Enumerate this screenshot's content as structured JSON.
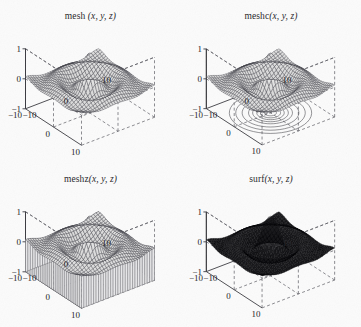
{
  "figure": {
    "background_color": "#fbfbfb",
    "ink_color": "#26262a",
    "grid_color": "#55555c",
    "panel_count": 4,
    "layout": "2x2"
  },
  "panels": [
    {
      "id": "mesh",
      "title_fn": "mesh",
      "title_args": "(x, y, z)",
      "render_style": "wireframe",
      "has_contour": false,
      "has_curtain": false,
      "filled": false
    },
    {
      "id": "meshc",
      "title_fn": "meshc",
      "title_args": "(x, y, z)",
      "render_style": "wireframe-with-contour",
      "has_contour": true,
      "has_curtain": false,
      "filled": false
    },
    {
      "id": "meshz",
      "title_fn": "meshz",
      "title_args": "(x, y, z)",
      "render_style": "wireframe-with-curtain",
      "has_contour": false,
      "has_curtain": true,
      "filled": false
    },
    {
      "id": "surf",
      "title_fn": "surf",
      "title_args": "(x, y, z)",
      "render_style": "shaded-surface",
      "has_contour": false,
      "has_curtain": false,
      "filled": true
    }
  ],
  "chart_data": {
    "type": "surface",
    "subplots": [
      "mesh (x, y, z)",
      "meshc (x, y, z)",
      "meshz (x, y, z)",
      "surf (x, y, z)"
    ],
    "function": "z = sin(r)/r,  r = sqrt(x^2 + y^2)",
    "xlabel": "x",
    "ylabel": "y",
    "zlabel": "z",
    "xlim": [
      -10,
      10
    ],
    "ylim": [
      -10,
      10
    ],
    "zlim": [
      -1,
      1
    ],
    "xticks": [
      -10,
      0,
      10
    ],
    "yticks": [
      -10,
      0,
      10
    ],
    "zticks": [
      -1,
      0,
      1
    ],
    "xtick_labels": [
      "-10",
      "0",
      "10"
    ],
    "ytick_labels": [
      "-10",
      "0",
      "10"
    ],
    "ztick_labels": [
      "-1",
      "0",
      "1"
    ],
    "grid": true,
    "grid_style": "dashed",
    "legend": null,
    "contour_levels": [
      -0.2,
      -0.1,
      0,
      0.1,
      0.2,
      0.35,
      0.5,
      0.7
    ],
    "view_azimuth": -37.5,
    "view_elevation": 30,
    "mesh_n": 30,
    "peak_value": 1.0,
    "min_value": -0.22
  },
  "axis_labels": {
    "z_top": "1",
    "z_mid": "0",
    "z_bottom": "−1",
    "y_back": "10",
    "y_mid": "0",
    "y_front": "−10",
    "x_front": "−10",
    "x_mid": "0",
    "x_back": "10"
  }
}
